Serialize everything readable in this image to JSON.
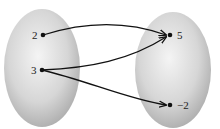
{
  "diagram": {
    "type": "mapping",
    "domain": {
      "elements": [
        {
          "label": "2",
          "x": 43,
          "y": 35
        },
        {
          "label": "3",
          "x": 42,
          "y": 70
        }
      ]
    },
    "range": {
      "elements": [
        {
          "label": "5",
          "x": 170,
          "y": 35
        },
        {
          "label": "−2",
          "x": 170,
          "y": 105
        }
      ]
    },
    "arrows": [
      {
        "from": "2",
        "to": "5"
      },
      {
        "from": "3",
        "to": "5"
      },
      {
        "from": "3",
        "to": "−2"
      }
    ],
    "colors": {
      "oval_center": "#f2f2f2",
      "oval_edge": "#a8a8a8",
      "arrow": "#111111"
    }
  }
}
